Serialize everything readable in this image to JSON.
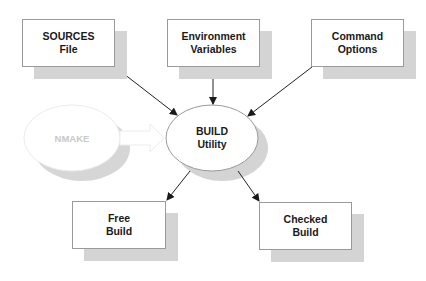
{
  "diagram": {
    "inputs": [
      {
        "id": "sources",
        "line1": "SOURCES",
        "line2": "File"
      },
      {
        "id": "env",
        "line1": "Environment",
        "line2": "Variables"
      },
      {
        "id": "cmd",
        "line1": "Command",
        "line2": "Options"
      }
    ],
    "center": {
      "line1": "BUILD",
      "line2": "Utility"
    },
    "faded": {
      "label": "NMAKE"
    },
    "outputs": [
      {
        "id": "free",
        "line1": "Free",
        "line2": "Build"
      },
      {
        "id": "checked",
        "line1": "Checked",
        "line2": "Build"
      }
    ],
    "colors": {
      "shadow": "#d4d4d4",
      "border": "#9a9a9a",
      "text": "#1a1a1a",
      "faded_text": "#c8c8c8",
      "arrow": "#222222"
    }
  }
}
